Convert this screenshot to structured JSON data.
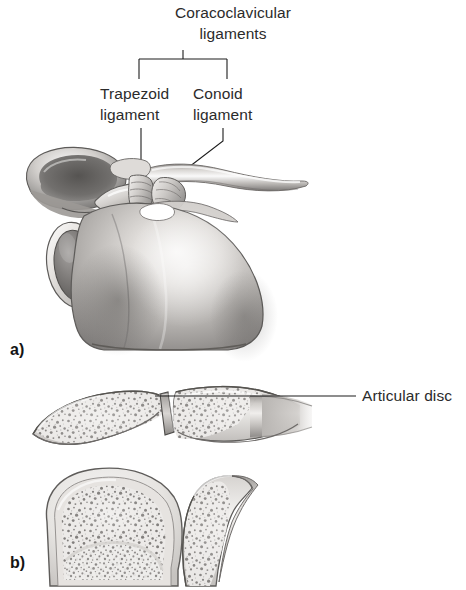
{
  "figure": {
    "type": "anatomical-illustration",
    "background_color": "#ffffff",
    "ink_color": "#1c1c1c",
    "bone_light": "#f2f0ee",
    "bone_mid": "#b9b6b3",
    "bone_dark": "#6e6b69"
  },
  "panel_a": {
    "letter": "a)",
    "bracket_label": "Coracoclavicular\nligaments",
    "bracket_label_line1": "Coracoclavicular",
    "bracket_label_line2": "ligaments",
    "labels": [
      {
        "id": "trapezoid",
        "line1": "Trapezoid",
        "line2": "ligament",
        "leader": "vertical"
      },
      {
        "id": "conoid",
        "line1": "Conoid",
        "line2": "ligament",
        "leader": "elbow-diagonal"
      }
    ],
    "structures": [
      "clavicle",
      "acromion",
      "coracoid-process",
      "glenoid-cavity",
      "scapula-body",
      "trapezoid-ligament",
      "conoid-ligament"
    ]
  },
  "panel_b": {
    "letter": "b)",
    "labels": [
      {
        "id": "articular-disc",
        "text": "Articular disc",
        "leader": "horizontal"
      }
    ],
    "structures": [
      "clavicle-section",
      "acromion-section",
      "articular-disc",
      "humeral-head-section",
      "glenoid-section",
      "trabecular-bone"
    ]
  },
  "caption": {
    "text": "",
    "note": "clipped"
  }
}
